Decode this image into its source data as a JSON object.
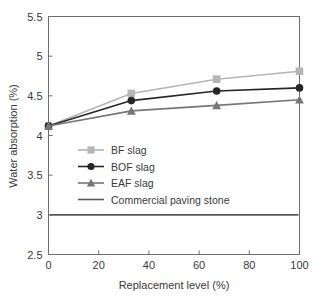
{
  "chart_data": {
    "type": "line",
    "title": "",
    "xlabel": "Replacement level (%)",
    "ylabel": "Water absorption (%)",
    "x": [
      0,
      33,
      67,
      100
    ],
    "xlim": [
      0,
      100
    ],
    "ylim": [
      2.5,
      5.5
    ],
    "xticks": [
      0,
      20,
      40,
      60,
      80,
      100
    ],
    "xtick_labels": [
      "0",
      "20",
      "40",
      "60",
      "80",
      "100"
    ],
    "yticks": [
      2.5,
      3,
      3.5,
      4,
      4.5,
      5,
      5.5
    ],
    "ytick_labels": [
      "2.5",
      "3",
      "3.5",
      "4",
      "4.5",
      "5",
      "5.5"
    ],
    "grid": false,
    "legend_position": "center-left",
    "series": [
      {
        "name": "BF slag",
        "marker": "square",
        "color": "#b5b5b5",
        "values": [
          4.12,
          4.53,
          4.71,
          4.81
        ]
      },
      {
        "name": "BOF slag",
        "marker": "circle",
        "color": "#262626",
        "values": [
          4.12,
          4.44,
          4.56,
          4.6
        ]
      },
      {
        "name": "EAF slag",
        "marker": "triangle",
        "color": "#767676",
        "values": [
          4.12,
          4.31,
          4.38,
          4.45
        ]
      },
      {
        "name": "Commercial paving stone",
        "marker": "none",
        "color": "#585858",
        "reference_value": 3.0,
        "values": [
          3.0,
          3.0,
          3.0,
          3.0
        ]
      }
    ]
  },
  "axes": {
    "xlabel": "Replacement level (%)",
    "ylabel": "Water absorption (%)",
    "xtick_labels": [
      "0",
      "20",
      "40",
      "60",
      "80",
      "100"
    ],
    "ytick_labels": [
      "5.5",
      "5",
      "4.5",
      "4",
      "3.5",
      "3",
      "2.5"
    ]
  },
  "legend": {
    "items": [
      {
        "label": "BF slag",
        "color": "#b5b5b5",
        "marker": "square"
      },
      {
        "label": "BOF slag",
        "color": "#262626",
        "marker": "circle"
      },
      {
        "label": "EAF slag",
        "color": "#767676",
        "marker": "triangle"
      },
      {
        "label": "Commercial paving stone",
        "color": "#585858",
        "marker": "none"
      }
    ]
  },
  "colors": {
    "bf_slag": "#b5b5b5",
    "bof_slag": "#262626",
    "eaf_slag": "#767676",
    "commercial": "#585858",
    "axis": "#6e6e6e",
    "text": "#3a3a3a",
    "background": "#ffffff"
  }
}
